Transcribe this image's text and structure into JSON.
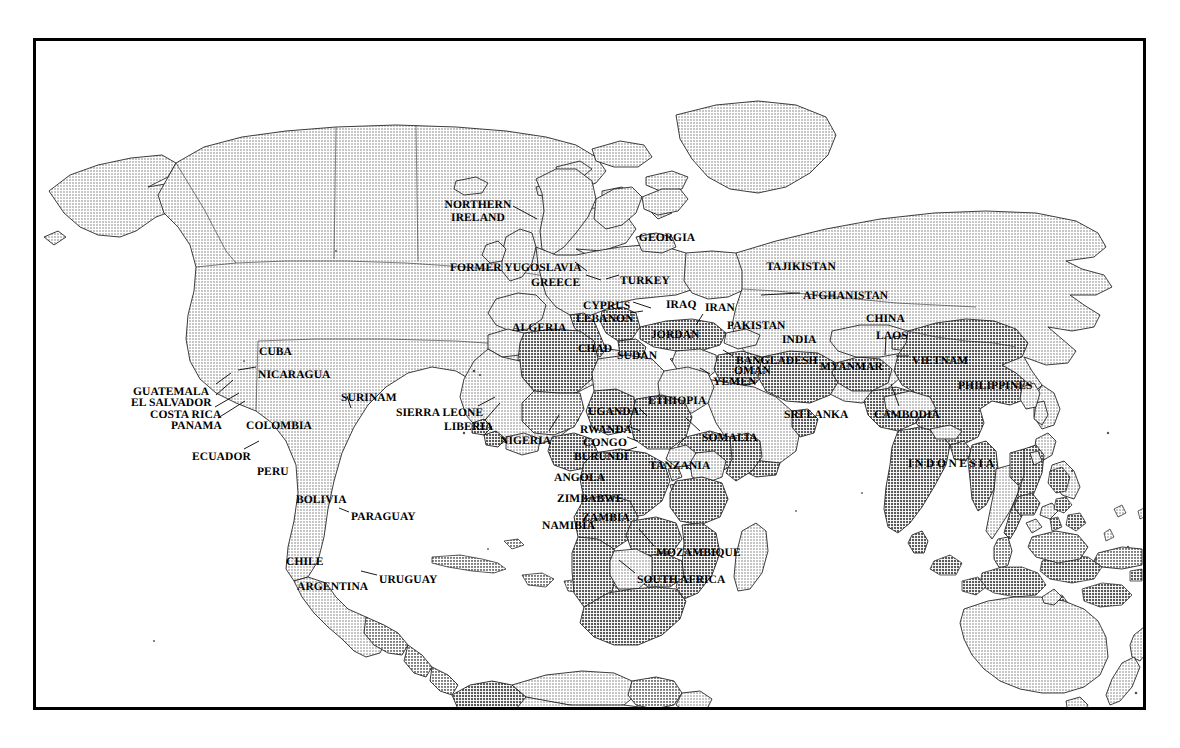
{
  "document": {
    "type": "world-map-figure",
    "title": "World map with selected countries labelled",
    "frame": {
      "border_color": "#000000",
      "background": "#ffffff"
    },
    "shading": {
      "land_light": "#d4d4d4",
      "land_mid": "#bdbdbd",
      "land_dark": "#a6a6a6",
      "ocean": "#ffffff",
      "outline": "#1a1a1a"
    }
  },
  "labels": [
    {
      "id": "northern-ireland",
      "text": "NORTHERN\nIRELAND",
      "x": 475,
      "y": 196,
      "align": "c",
      "lines": 2
    },
    {
      "id": "georgia",
      "text": "GEORGIA",
      "x": 664,
      "y": 229,
      "align": "c"
    },
    {
      "id": "former-yugoslavia",
      "text": "FORMER YUGOSLAVIA",
      "x": 447,
      "y": 259,
      "align": "l"
    },
    {
      "id": "tajikistan",
      "text": "TAJIKISTAN",
      "x": 798,
      "y": 258,
      "align": "c"
    },
    {
      "id": "greece",
      "text": "GREECE",
      "x": 528,
      "y": 274,
      "align": "l"
    },
    {
      "id": "turkey",
      "text": "TURKEY",
      "x": 617,
      "y": 272,
      "align": "l"
    },
    {
      "id": "afghanistan",
      "text": "AFGHANISTAN",
      "x": 800,
      "y": 287,
      "align": "l"
    },
    {
      "id": "cyprus",
      "text": "CYPRUS",
      "x": 580,
      "y": 297,
      "align": "l"
    },
    {
      "id": "iraq",
      "text": "IRAQ",
      "x": 663,
      "y": 296,
      "align": "l"
    },
    {
      "id": "iran",
      "text": "IRAN",
      "x": 702,
      "y": 299,
      "align": "l"
    },
    {
      "id": "lebanon",
      "text": "LEBANON",
      "x": 573,
      "y": 310,
      "align": "l"
    },
    {
      "id": "china",
      "text": "CHINA",
      "x": 863,
      "y": 310,
      "align": "l"
    },
    {
      "id": "algeria",
      "text": "ALGERIA",
      "x": 509,
      "y": 319,
      "align": "l"
    },
    {
      "id": "pakistan",
      "text": "PAKISTAN",
      "x": 724,
      "y": 317,
      "align": "l"
    },
    {
      "id": "jordan",
      "text": "JORDAN",
      "x": 648,
      "y": 326,
      "align": "l"
    },
    {
      "id": "laos",
      "text": "LAOS",
      "x": 873,
      "y": 327,
      "align": "l"
    },
    {
      "id": "india",
      "text": "INDIA",
      "x": 779,
      "y": 331,
      "align": "l"
    },
    {
      "id": "cuba",
      "text": "CUBA",
      "x": 256,
      "y": 343,
      "align": "l"
    },
    {
      "id": "chad",
      "text": "CHAD",
      "x": 575,
      "y": 340,
      "align": "l"
    },
    {
      "id": "sudan",
      "text": "SUDAN",
      "x": 614,
      "y": 347,
      "align": "l"
    },
    {
      "id": "bangladesh",
      "text": "BANGLADESH",
      "x": 733,
      "y": 352,
      "align": "l"
    },
    {
      "id": "myanmar",
      "text": "MYANMAR",
      "x": 817,
      "y": 358,
      "align": "l"
    },
    {
      "id": "vietnam",
      "text": "VIETNAM",
      "x": 909,
      "y": 352,
      "align": "l"
    },
    {
      "id": "nicaragua",
      "text": "NICARAGUA",
      "x": 255,
      "y": 366,
      "align": "l"
    },
    {
      "id": "oman",
      "text": "OMAN",
      "x": 731,
      "y": 362,
      "align": "l"
    },
    {
      "id": "yemen",
      "text": "YEMEN",
      "x": 710,
      "y": 373,
      "align": "l"
    },
    {
      "id": "guatemala",
      "text": "GUATEMALA",
      "x": 130,
      "y": 383,
      "align": "l"
    },
    {
      "id": "surinam",
      "text": "SURINAM",
      "x": 338,
      "y": 389,
      "align": "l"
    },
    {
      "id": "philippines",
      "text": "PHILIPPINES",
      "x": 955,
      "y": 377,
      "align": "l"
    },
    {
      "id": "el-salvador",
      "text": "EL SALVADOR",
      "x": 128,
      "y": 394,
      "align": "l"
    },
    {
      "id": "ethiopia",
      "text": "ETHIOPIA",
      "x": 645,
      "y": 392,
      "align": "l"
    },
    {
      "id": "sierra-leone",
      "text": "SIERRA LEONE",
      "x": 393,
      "y": 404,
      "align": "l"
    },
    {
      "id": "costa-rica",
      "text": "COSTA RICA",
      "x": 147,
      "y": 406,
      "align": "l"
    },
    {
      "id": "uganda",
      "text": "UGANDA",
      "x": 585,
      "y": 403,
      "align": "l"
    },
    {
      "id": "sri-lanka",
      "text": "SRI LANKA",
      "x": 781,
      "y": 406,
      "align": "l"
    },
    {
      "id": "cambodia",
      "text": "CAMBODIA",
      "x": 871,
      "y": 406,
      "align": "l"
    },
    {
      "id": "panama",
      "text": "PANAMA",
      "x": 168,
      "y": 417,
      "align": "l"
    },
    {
      "id": "colombia",
      "text": "COLOMBIA",
      "x": 243,
      "y": 417,
      "align": "l"
    },
    {
      "id": "liberia",
      "text": "LIBERIA",
      "x": 441,
      "y": 418,
      "align": "l"
    },
    {
      "id": "rwanda",
      "text": "RWANDA",
      "x": 577,
      "y": 421,
      "align": "l"
    },
    {
      "id": "nigeria",
      "text": "NIGERIA",
      "x": 497,
      "y": 432,
      "align": "l"
    },
    {
      "id": "congo",
      "text": "CONGO",
      "x": 580,
      "y": 434,
      "align": "l"
    },
    {
      "id": "somalia",
      "text": "SOMALIA",
      "x": 699,
      "y": 429,
      "align": "l"
    },
    {
      "id": "ecuador",
      "text": "ECUADOR",
      "x": 189,
      "y": 448,
      "align": "l"
    },
    {
      "id": "burundi",
      "text": "BURUNDI",
      "x": 571,
      "y": 448,
      "align": "l"
    },
    {
      "id": "tanzania",
      "text": "TANZANIA",
      "x": 646,
      "y": 457,
      "align": "l"
    },
    {
      "id": "indonesia",
      "text": "INDONESIA",
      "x": 905,
      "y": 455,
      "align": "l",
      "spaced": true
    },
    {
      "id": "peru",
      "text": "PERU",
      "x": 254,
      "y": 463,
      "align": "l"
    },
    {
      "id": "angola",
      "text": "ANGOLA",
      "x": 551,
      "y": 469,
      "align": "l"
    },
    {
      "id": "zimbabwe",
      "text": "ZIMBABWE",
      "x": 554,
      "y": 490,
      "align": "l"
    },
    {
      "id": "bolivia",
      "text": "BOLIVIA",
      "x": 293,
      "y": 491,
      "align": "l"
    },
    {
      "id": "zambia",
      "text": "ZAMBIA",
      "x": 579,
      "y": 509,
      "align": "l"
    },
    {
      "id": "paraguay",
      "text": "PARAGUAY",
      "x": 348,
      "y": 508,
      "align": "l"
    },
    {
      "id": "namibia",
      "text": "NAMIBIA",
      "x": 539,
      "y": 517,
      "align": "l"
    },
    {
      "id": "mozambique",
      "text": "MOZAMBIQUE",
      "x": 653,
      "y": 544,
      "align": "l"
    },
    {
      "id": "chile",
      "text": "CHILE",
      "x": 283,
      "y": 553,
      "align": "l"
    },
    {
      "id": "argentina",
      "text": "ARGENTINA",
      "x": 294,
      "y": 578,
      "align": "l"
    },
    {
      "id": "uruguay",
      "text": "URUGUAY",
      "x": 376,
      "y": 571,
      "align": "l"
    },
    {
      "id": "south-africa",
      "text": "SOUTH AFRICA",
      "x": 634,
      "y": 571,
      "align": "l"
    }
  ],
  "leader_lines": [
    {
      "id": "northern-ireland",
      "x1": 510,
      "y1": 203,
      "x2": 534,
      "y2": 216
    },
    {
      "id": "former-yugoslavia",
      "x1": 572,
      "y1": 259,
      "x2": 584,
      "y2": 268
    },
    {
      "id": "greece",
      "x1": 583,
      "y1": 272,
      "x2": 598,
      "y2": 277
    },
    {
      "id": "turkey",
      "x1": 616,
      "y1": 272,
      "x2": 603,
      "y2": 276
    },
    {
      "id": "cyprus",
      "x1": 630,
      "y1": 299,
      "x2": 648,
      "y2": 305
    },
    {
      "id": "lebanon",
      "x1": 627,
      "y1": 310,
      "x2": 640,
      "y2": 308
    },
    {
      "id": "jordan",
      "x1": 693,
      "y1": 322,
      "x2": 700,
      "y2": 311
    },
    {
      "id": "afghanistan",
      "x1": 797,
      "y1": 290,
      "x2": 758,
      "y2": 292
    },
    {
      "id": "bangladesh",
      "x1": 730,
      "y1": 353,
      "x2": 720,
      "y2": 347
    },
    {
      "id": "yemen",
      "x1": 707,
      "y1": 371,
      "x2": 697,
      "y2": 365
    },
    {
      "id": "vietnam",
      "x1": 906,
      "y1": 353,
      "x2": 893,
      "y2": 353
    },
    {
      "id": "cambodia",
      "x1": 896,
      "y1": 403,
      "x2": 888,
      "y2": 381
    },
    {
      "id": "laos",
      "x1": 883,
      "y1": 334,
      "x2": 882,
      "y2": 352
    },
    {
      "id": "sierra-leone",
      "x1": 475,
      "y1": 403,
      "x2": 492,
      "y2": 394
    },
    {
      "id": "liberia",
      "x1": 482,
      "y1": 417,
      "x2": 497,
      "y2": 400
    },
    {
      "id": "nigeria",
      "x1": 546,
      "y1": 428,
      "x2": 556,
      "y2": 412
    },
    {
      "id": "uganda",
      "x1": 636,
      "y1": 405,
      "x2": 644,
      "y2": 413
    },
    {
      "id": "rwanda",
      "x1": 625,
      "y1": 423,
      "x2": 637,
      "y2": 428
    },
    {
      "id": "congo",
      "x1": 624,
      "y1": 434,
      "x2": 634,
      "y2": 438
    },
    {
      "id": "burundi",
      "x1": 622,
      "y1": 448,
      "x2": 634,
      "y2": 444
    },
    {
      "id": "somalia",
      "x1": 697,
      "y1": 428,
      "x2": 683,
      "y2": 415
    },
    {
      "id": "mozambique",
      "x1": 651,
      "y1": 543,
      "x2": 636,
      "y2": 526
    },
    {
      "id": "south-africa",
      "x1": 632,
      "y1": 570,
      "x2": 616,
      "y2": 557
    },
    {
      "id": "namibia",
      "x1": 588,
      "y1": 520,
      "x2": 594,
      "y2": 515
    },
    {
      "id": "nicaragua",
      "x1": 253,
      "y1": 364,
      "x2": 235,
      "y2": 367
    },
    {
      "id": "guatemala",
      "x1": 213,
      "y1": 381,
      "x2": 228,
      "y2": 370
    },
    {
      "id": "el-salvador",
      "x1": 213,
      "y1": 392,
      "x2": 230,
      "y2": 377
    },
    {
      "id": "costa-rica",
      "x1": 212,
      "y1": 404,
      "x2": 236,
      "y2": 390
    },
    {
      "id": "panama",
      "x1": 215,
      "y1": 415,
      "x2": 242,
      "y2": 398
    },
    {
      "id": "ecuador",
      "x1": 241,
      "y1": 446,
      "x2": 256,
      "y2": 438
    },
    {
      "id": "surinam",
      "x1": 344,
      "y1": 393,
      "x2": 348,
      "y2": 405
    },
    {
      "id": "uruguay",
      "x1": 374,
      "y1": 572,
      "x2": 358,
      "y2": 568
    },
    {
      "id": "paraguay",
      "x1": 346,
      "y1": 509,
      "x2": 336,
      "y2": 505
    }
  ],
  "regions": [
    {
      "id": "north-america",
      "tone": "light",
      "labelled": false
    },
    {
      "id": "greenland",
      "tone": "light",
      "labelled": false
    },
    {
      "id": "russia",
      "tone": "light",
      "labelled": false
    },
    {
      "id": "europe",
      "tone": "light",
      "labelled": false
    },
    {
      "id": "australia",
      "tone": "light",
      "labelled": false
    },
    {
      "id": "new-zealand",
      "tone": "light",
      "labelled": false
    },
    {
      "id": "south-america",
      "tone": "mixed",
      "labelled": true
    },
    {
      "id": "africa",
      "tone": "mixed",
      "labelled": true
    },
    {
      "id": "asia",
      "tone": "mixed",
      "labelled": true
    }
  ]
}
